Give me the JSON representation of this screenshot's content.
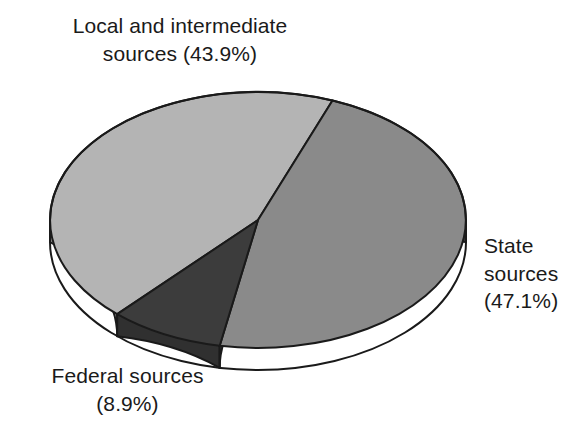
{
  "chart_data": {
    "type": "pie",
    "title": "",
    "subtitle": "",
    "xlabel": "",
    "ylabel": "",
    "legend_position": "none",
    "grid": false,
    "three_d": true,
    "units": "percent",
    "categories": [
      "State sources",
      "Local and intermediate sources",
      "Federal sources"
    ],
    "values": [
      47.1,
      43.9,
      8.9
    ],
    "slices": [
      {
        "name": "State sources",
        "label_line1": "State",
        "label_line2": "sources",
        "label_line3": "(47.1%)",
        "label_text": "State\nsources\n(47.1%)",
        "value": 47.1,
        "value_text": "47.1%",
        "color": "#8a8a8a",
        "side_color": "#3c3c3c",
        "start_angle": 21,
        "sweep_angle": 169.6
      },
      {
        "name": "Local and intermediate sources",
        "label_line1": "Local and intermediate",
        "label_line2": "sources (43.9%)",
        "label_text": "Local and intermediate\nsources (43.9%)",
        "value": 43.9,
        "value_text": "43.9%",
        "color": "#b4b4b4",
        "side_color": "#8c8c8c",
        "start_angle": 222.6,
        "sweep_angle": 158.4
      },
      {
        "name": "Federal sources",
        "label_line1": "Federal sources",
        "label_line2": "(8.9%)",
        "label_text": "Federal sources\n(8.9%)",
        "value": 8.9,
        "value_text": "8.9%",
        "color": "#3c3c3c",
        "side_color": "#303030",
        "start_angle": 190.6,
        "sweep_angle": 32.0
      }
    ],
    "geometry": {
      "center_x": 258,
      "center_y": 220,
      "radius_x": 208,
      "radius_y": 128,
      "depth": 22
    },
    "colors": {
      "background": "#ffffff",
      "outline": "#1a1a1a",
      "text": "#1a1a1a",
      "light_gray": "#b4b4b4",
      "medium_gray": "#8a8a8a",
      "dark_gray": "#3c3c3c"
    }
  }
}
